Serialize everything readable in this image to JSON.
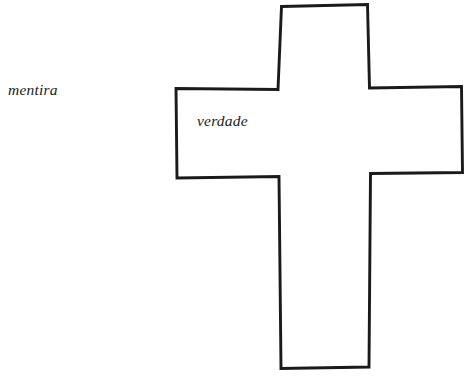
{
  "page": {
    "background_color": "#ffffff",
    "width": 474,
    "height": 377
  },
  "diagram": {
    "name": "cross-diagram",
    "type": "hand-drawn outline",
    "stroke_color": "#1a1a1a",
    "fill_color": "#ffffff",
    "stroke_width": 2.8,
    "shape": "latin-cross",
    "geometry": {
      "vertical_bar": {
        "left": 277,
        "right": 371,
        "top": 5,
        "bottom": 368
      },
      "horizontal_bar": {
        "left": 176,
        "right": 462,
        "top": 88,
        "bottom": 177
      }
    }
  },
  "labels": {
    "outside": {
      "text": "mentira",
      "x": 8,
      "y": 81,
      "style": "italic-serif"
    },
    "inside": {
      "text": "verdade",
      "x": 197,
      "y": 112,
      "style": "italic-serif"
    }
  }
}
